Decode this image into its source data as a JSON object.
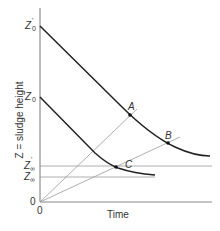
{
  "diagram": {
    "y_axis_label": "Z = sludge height",
    "x_axis_label": "Time",
    "y_ticks": {
      "z0_prime": {
        "main": "Z",
        "sup": "'",
        "sub": "0"
      },
      "z0": {
        "main": "Z",
        "sub": "0"
      },
      "zinf_prime": {
        "main": "Z",
        "sup": "'",
        "sub": "∞"
      },
      "zinf": {
        "main": "Z",
        "sub": "∞"
      },
      "origin_y": "0"
    },
    "origin_x": "0",
    "points": {
      "A": "A",
      "B": "B",
      "C": "C"
    },
    "colors": {
      "curve": "#222222",
      "axis": "#777777",
      "guide": "#999999",
      "text": "#333333"
    }
  }
}
